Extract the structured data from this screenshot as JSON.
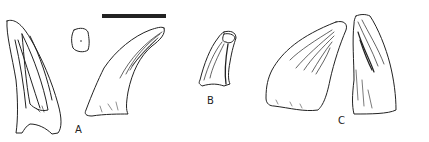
{
  "figure": {
    "labels": {
      "a": "A",
      "b": "B",
      "c": "C"
    },
    "colors": {
      "ink": "#222222",
      "background": "#ffffff"
    },
    "specimens": [
      {
        "id": "A",
        "views": [
          "tooth-lateral-left",
          "tooth-cross-section",
          "tooth-lateral-right"
        ]
      },
      {
        "id": "B",
        "views": [
          "tooth-lateral"
        ]
      },
      {
        "id": "C",
        "views": [
          "tooth-lateral-left",
          "tooth-lateral-right"
        ]
      }
    ],
    "scale_bar": {
      "present": true
    }
  }
}
